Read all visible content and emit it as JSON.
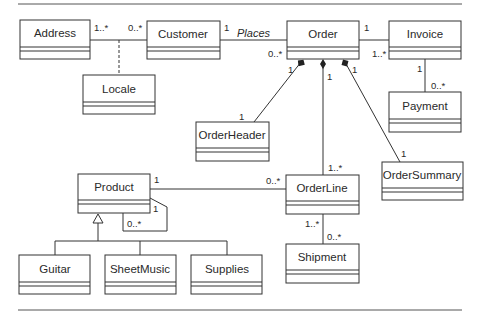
{
  "diagram": {
    "type": "UML class diagram",
    "classes": {
      "address": "Address",
      "customer": "Customer",
      "order": "Order",
      "invoice": "Invoice",
      "locale": "Locale",
      "payment": "Payment",
      "order_header": "OrderHeader",
      "order_line": "OrderLine",
      "order_summary": "OrderSummary",
      "product": "Product",
      "guitar": "Guitar",
      "sheet_music": "SheetMusic",
      "supplies": "Supplies",
      "shipment": "Shipment"
    },
    "associations": {
      "address_customer": {
        "address_end": "1..*",
        "customer_end": "0..*",
        "association_class": "Locale"
      },
      "customer_order": {
        "label": "Places",
        "customer_end": "1",
        "order_end": "0..*"
      },
      "order_invoice": {
        "order_end": "1",
        "invoice_end": "1..*"
      },
      "invoice_payment": {
        "invoice_end": "1",
        "payment_end": "0..*"
      },
      "order_orderheader": {
        "order_end": "1",
        "orderheader_end": "1",
        "kind": "composition"
      },
      "order_orderline": {
        "order_end": "1",
        "orderline_end": "1..*",
        "kind": "composition"
      },
      "order_ordersummary": {
        "order_end": "1",
        "ordersummary_end": "1",
        "kind": "composition"
      },
      "product_orderline": {
        "product_end": "1",
        "orderline_end": "0..*"
      },
      "product_self": {
        "end_a": "1",
        "end_b": "0..*"
      },
      "orderline_shipment": {
        "orderline_end": "1..*",
        "shipment_end": "0..*"
      }
    },
    "generalization": {
      "parent": "Product",
      "children": [
        "Guitar",
        "SheetMusic",
        "Supplies"
      ]
    }
  }
}
